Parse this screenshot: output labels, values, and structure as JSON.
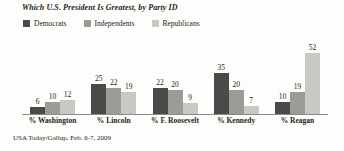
{
  "chart_data": {
    "type": "bar",
    "title": "Which U.S. President Is Greatest, by Party ID",
    "xlabel": "",
    "ylabel": "",
    "ylim": [
      0,
      55
    ],
    "grid": false,
    "legend_position": "top-left",
    "source": "USA Today/Gallup, Feb. 6-7, 2009",
    "categories": [
      "% Washington",
      "% Lincoln",
      "% F. Roosevelt",
      "% Kennedy",
      "% Reagan"
    ],
    "series": [
      {
        "name": "Democrats",
        "color": "#4a4a48",
        "values": [
          6,
          25,
          22,
          35,
          10
        ]
      },
      {
        "name": "Independents",
        "color": "#9b9b97",
        "values": [
          10,
          22,
          20,
          20,
          19
        ]
      },
      {
        "name": "Republicans",
        "color": "#c9c9c4",
        "values": [
          12,
          19,
          9,
          7,
          52
        ]
      }
    ]
  },
  "axis": {
    "baseline_color": "#8d8a85"
  }
}
